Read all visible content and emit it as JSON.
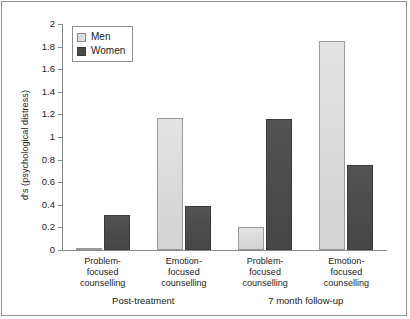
{
  "chart_data": {
    "type": "bar",
    "title": "",
    "xlabel": "",
    "ylabel": "d's (psychological distress)",
    "ylim": [
      0,
      2
    ],
    "ytick_labels": [
      "0",
      "0.2",
      "0.4",
      "0.6",
      "0.8",
      "1",
      "1.2",
      "1.4",
      "1.6",
      "1.8",
      "2"
    ],
    "ytick_values": [
      0,
      0.2,
      0.4,
      0.6,
      0.8,
      1,
      1.2,
      1.4,
      1.6,
      1.8,
      2
    ],
    "grid": false,
    "legend_position": "upper-left-inside",
    "categories": [
      "Problem-focused counselling",
      "Emotion-focused counselling",
      "Problem-focused counselling",
      "Emotion-focused counselling"
    ],
    "category_lines": [
      [
        "Problem-",
        "focused",
        "counselling"
      ],
      [
        "Emotion-",
        "focused",
        "counselling"
      ],
      [
        "Problem-",
        "focused",
        "counselling"
      ],
      [
        "Emotion-",
        "focused",
        "counselling"
      ]
    ],
    "panels": [
      {
        "label": "Post-treatment",
        "category_indices": [
          0,
          1
        ]
      },
      {
        "label": "7 month follow-up",
        "category_indices": [
          2,
          3
        ]
      }
    ],
    "series": [
      {
        "name": "Men",
        "color": "#dcdcdc",
        "values": [
          0.02,
          1.17,
          0.2,
          1.85
        ]
      },
      {
        "name": "Women",
        "color": "#4a4a4a",
        "values": [
          0.31,
          0.39,
          1.16,
          0.75
        ]
      }
    ]
  },
  "legend": {
    "items": [
      {
        "label": "Men",
        "swatch": "men"
      },
      {
        "label": "Women",
        "swatch": "women"
      }
    ]
  },
  "colors": {
    "men": "#dcdcdc",
    "women": "#4a4a4a",
    "axis": "#8a8a8a",
    "text": "#1a1a1a",
    "background": "#ffffff"
  }
}
